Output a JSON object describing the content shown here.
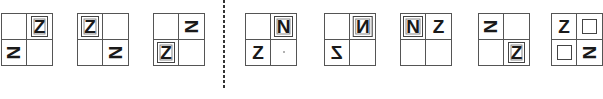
{
  "puzzle": {
    "description": "Figure-reasoning puzzle: 2x2 grids containing letters Z and N; question figures left of dashed divider, option figures right",
    "question_figures": [
      {
        "cells": [
          {
            "glyph": "",
            "style": "empty"
          },
          {
            "glyph": "Z",
            "style": "boxed"
          },
          {
            "glyph": "N",
            "style": "rotated-90"
          },
          {
            "glyph": "",
            "style": "empty"
          }
        ]
      },
      {
        "cells": [
          {
            "glyph": "Z",
            "style": "boxed"
          },
          {
            "glyph": "",
            "style": "empty"
          },
          {
            "glyph": "",
            "style": "empty"
          },
          {
            "glyph": "N",
            "style": "rotated-90"
          }
        ]
      },
      {
        "cells": [
          {
            "glyph": "",
            "style": "empty"
          },
          {
            "glyph": "N",
            "style": "rotated-90"
          },
          {
            "glyph": "Z",
            "style": "boxed"
          },
          {
            "glyph": "",
            "style": "empty"
          }
        ]
      }
    ],
    "option_figures": [
      {
        "cells": [
          {
            "glyph": "",
            "style": "empty"
          },
          {
            "glyph": "N",
            "style": "boxed"
          },
          {
            "glyph": "Z",
            "style": "plain"
          },
          {
            "glyph": "",
            "style": "dot"
          }
        ]
      },
      {
        "cells": [
          {
            "glyph": "",
            "style": "empty"
          },
          {
            "glyph": "N",
            "style": "boxed-mirrored"
          },
          {
            "glyph": "Z",
            "style": "mirrored"
          },
          {
            "glyph": "",
            "style": "empty"
          }
        ]
      },
      {
        "cells": [
          {
            "glyph": "N",
            "style": "boxed"
          },
          {
            "glyph": "Z",
            "style": "plain"
          },
          {
            "glyph": "",
            "style": "empty"
          },
          {
            "glyph": "",
            "style": "empty"
          }
        ]
      },
      {
        "cells": [
          {
            "glyph": "N",
            "style": "rotated-90"
          },
          {
            "glyph": "",
            "style": "empty"
          },
          {
            "glyph": "",
            "style": "empty"
          },
          {
            "glyph": "Z",
            "style": "boxed"
          }
        ]
      },
      {
        "cells": [
          {
            "glyph": "Z",
            "style": "plain"
          },
          {
            "glyph": "",
            "style": "empty-box"
          },
          {
            "glyph": "",
            "style": "empty-box"
          },
          {
            "glyph": "N",
            "style": "rotated-90"
          }
        ]
      }
    ]
  }
}
